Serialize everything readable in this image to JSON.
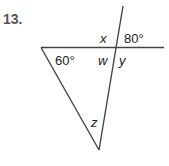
{
  "problem": {
    "number": "13."
  },
  "figure": {
    "type": "triangle with transversal",
    "labels": {
      "x": "x",
      "angle_top_right": "80°",
      "angle_left": "60°",
      "w": "w",
      "y": "y",
      "z": "z"
    },
    "line_color": "#444444"
  }
}
